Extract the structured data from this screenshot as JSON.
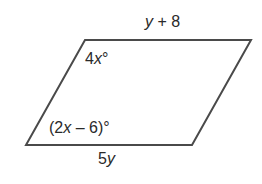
{
  "diagram": {
    "shape": "parallelogram",
    "stroke_color": "#4a4a4a",
    "vertices": [
      {
        "name": "top-left",
        "x": 85,
        "y": 40
      },
      {
        "name": "top-right",
        "x": 251,
        "y": 40
      },
      {
        "name": "bottom-right",
        "x": 192,
        "y": 145
      },
      {
        "name": "bottom-left",
        "x": 26,
        "y": 145
      }
    ],
    "labels": {
      "top_side": {
        "var": "y",
        "rest": " + 8"
      },
      "bottom_side": {
        "num": "5",
        "var": "y"
      },
      "top_left_angle": {
        "num": "4",
        "var": "x",
        "deg": "°"
      },
      "bottom_left_angle": {
        "pre": "(2",
        "var": "x",
        "rest": " – 6)°"
      }
    }
  }
}
